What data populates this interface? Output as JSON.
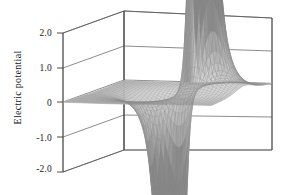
{
  "figure": {
    "axis_title": "Electric potential",
    "background_color": "#ffffff",
    "frame_color": "#4a4a4a",
    "mesh_color": "#8c8c8c"
  },
  "axis": {
    "ticks": [
      {
        "label": "2.0",
        "value": 2.0
      },
      {
        "label": "1.0",
        "value": 1.0
      },
      {
        "label": "0",
        "value": 0.0
      },
      {
        "label": "-1.0",
        "value": -1.0
      },
      {
        "label": "-2.0",
        "value": -2.0
      }
    ]
  },
  "chart_data": {
    "type": "surface",
    "title": "",
    "xlabel": "",
    "ylabel": "",
    "zlabel": "Electric potential",
    "zlim": [
      -2.0,
      2.0
    ],
    "ztick_labels": [
      "2.0",
      "1.0",
      "0",
      "-1.0",
      "-2.0"
    ],
    "ztick_values": [
      2.0,
      1.0,
      0.0,
      -1.0,
      -2.0
    ],
    "grid": true,
    "legend": "none",
    "projection": "3d-wireframe-surface",
    "features": [
      {
        "name": "positive-peak",
        "z_peak": 3.2,
        "clipped_above": true,
        "x": 0.15,
        "y": 0.1,
        "sign": "+"
      },
      {
        "name": "negative-trough",
        "z_peak": -3.2,
        "clipped_below": true,
        "x": 0.15,
        "y": -0.22,
        "sign": "-"
      },
      {
        "name": "flat-plane",
        "z": 0.0
      }
    ],
    "surface_shading": "grayscale-monochrome",
    "mesh_nx": 46,
    "mesh_ny": 46
  }
}
